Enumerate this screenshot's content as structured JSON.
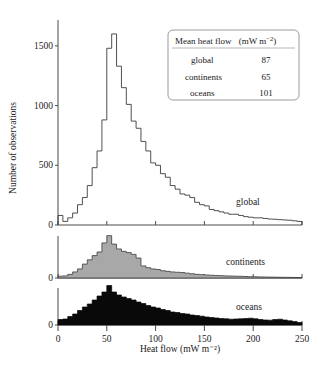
{
  "chart_data": {
    "type": "bar",
    "title": "",
    "xlabel": "Heat flow  (mW m⁻²)",
    "ylabel": "Number of observations",
    "xlim": [
      0,
      250
    ],
    "bin_width": 5,
    "grid": false,
    "xticks": [
      0,
      50,
      100,
      150,
      200,
      250
    ],
    "xticklabels": [
      "0",
      "50",
      "100",
      "150",
      "200",
      "250"
    ],
    "panels": [
      {
        "name": "global",
        "label": "global",
        "style": "outline",
        "ylim": [
          0,
          1700
        ],
        "yticks": [
          0,
          500,
          1000,
          1500
        ],
        "yticklabels": [
          "0",
          "500",
          "1000",
          "1500"
        ],
        "bin_starts": [
          0,
          5,
          10,
          15,
          20,
          25,
          30,
          35,
          40,
          45,
          50,
          55,
          60,
          65,
          70,
          75,
          80,
          85,
          90,
          95,
          100,
          105,
          110,
          115,
          120,
          125,
          130,
          135,
          140,
          145,
          150,
          155,
          160,
          165,
          170,
          175,
          180,
          185,
          190,
          195,
          200,
          205,
          210,
          215,
          220,
          225,
          230,
          235,
          240,
          245
        ],
        "values": [
          80,
          30,
          60,
          100,
          170,
          230,
          330,
          480,
          620,
          880,
          1480,
          1600,
          1330,
          1150,
          1010,
          870,
          810,
          700,
          620,
          520,
          500,
          430,
          400,
          330,
          300,
          260,
          250,
          230,
          190,
          170,
          160,
          130,
          120,
          110,
          100,
          90,
          90,
          80,
          70,
          65,
          60,
          60,
          55,
          50,
          48,
          45,
          42,
          40,
          35,
          30
        ]
      },
      {
        "name": "continents",
        "label": "continents",
        "style": "filled-gray",
        "ylim": [
          0,
          760
        ],
        "yticks": [
          0
        ],
        "yticklabels": [
          "0"
        ],
        "bin_starts": [
          0,
          5,
          10,
          15,
          20,
          25,
          30,
          35,
          40,
          45,
          50,
          55,
          60,
          65,
          70,
          75,
          80,
          85,
          90,
          95,
          100,
          105,
          110,
          115,
          120,
          125,
          130,
          135,
          140,
          145,
          150,
          155,
          160,
          165,
          170,
          175,
          180,
          185,
          190,
          195,
          200,
          205,
          210,
          215,
          220,
          225,
          230,
          235,
          240,
          245
        ],
        "values": [
          30,
          35,
          60,
          100,
          150,
          230,
          300,
          370,
          430,
          580,
          700,
          560,
          480,
          440,
          420,
          390,
          330,
          200,
          170,
          150,
          140,
          120,
          110,
          100,
          95,
          90,
          80,
          70,
          60,
          55,
          50,
          45,
          42,
          38,
          35,
          32,
          30,
          28,
          25,
          22,
          20,
          18,
          16,
          15,
          14,
          12,
          11,
          10,
          9,
          8
        ]
      },
      {
        "name": "oceans",
        "label": "oceans",
        "style": "filled-black",
        "ylim": [
          0,
          420
        ],
        "yticks": [
          0
        ],
        "yticklabels": [
          "0"
        ],
        "bin_starts": [
          0,
          5,
          10,
          15,
          20,
          25,
          30,
          35,
          40,
          45,
          50,
          55,
          60,
          65,
          70,
          75,
          80,
          85,
          90,
          95,
          100,
          105,
          110,
          115,
          120,
          125,
          130,
          135,
          140,
          145,
          150,
          155,
          160,
          165,
          170,
          175,
          180,
          185,
          190,
          195,
          200,
          205,
          210,
          215,
          220,
          225,
          230,
          235,
          240,
          245
        ],
        "values": [
          55,
          60,
          85,
          110,
          145,
          180,
          210,
          250,
          290,
          330,
          395,
          330,
          300,
          280,
          265,
          250,
          230,
          215,
          195,
          180,
          170,
          155,
          145,
          130,
          125,
          115,
          110,
          100,
          95,
          88,
          80,
          75,
          70,
          65,
          62,
          58,
          60,
          62,
          65,
          68,
          62,
          55,
          50,
          48,
          55,
          58,
          50,
          42,
          35,
          25
        ]
      }
    ]
  },
  "legend": {
    "title_main": "Mean heat flow",
    "title_unit": "(mW m",
    "title_unit_sup": "−2",
    "title_unit_end": ")",
    "rows": [
      {
        "label": "global",
        "value": "87"
      },
      {
        "label": "continents",
        "value": "65"
      },
      {
        "label": "oceans",
        "value": "101"
      }
    ]
  },
  "colors": {
    "background": "#ffffff",
    "axis": "#4a4a4a",
    "outline": "#3c3c3c",
    "continents_fill": "#a8a8a8",
    "oceans_fill": "#090909",
    "text": "#1a1a1a",
    "legend_border": "#8f8f8f"
  }
}
